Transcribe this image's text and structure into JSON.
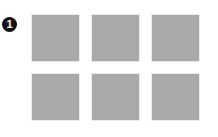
{
  "badge": {
    "label": "1"
  },
  "colors": {
    "tile": "#a9a9a9",
    "badge": "#111111",
    "background": "#ffffff"
  },
  "grid": {
    "rows": 2,
    "columns": 3,
    "tiles": [
      {
        "row": 0,
        "col": 0
      },
      {
        "row": 0,
        "col": 1
      },
      {
        "row": 0,
        "col": 2
      },
      {
        "row": 1,
        "col": 0
      },
      {
        "row": 1,
        "col": 1
      },
      {
        "row": 1,
        "col": 2
      }
    ]
  }
}
